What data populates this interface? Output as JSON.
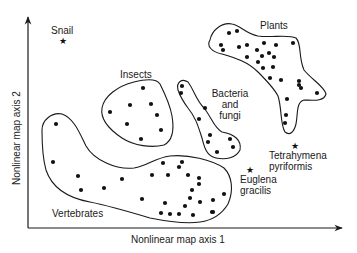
{
  "diagram": {
    "x_axis_label": "Nonlinear map axis 1",
    "y_axis_label": "Nonlinear map axis 2",
    "colors": {
      "ink": "#1a1a1a",
      "background": "#ffffff"
    }
  },
  "clusters": [
    {
      "name": "Plants",
      "label": "Plants",
      "label_pos": [
        260,
        29
      ],
      "outline": "M 210 40 C 212 30, 222 22, 232 24 C 240 25, 246 34, 258 36 C 272 38, 288 34, 296 38 C 302 44, 298 56, 304 70 C 312 80, 324 86, 326 94 C 324 102, 312 100, 304 100 C 296 102, 298 114, 296 124 C 294 132, 290 136, 285 132 C 280 124, 282 108, 278 96 C 274 88, 266 80, 258 72 C 248 62, 236 58, 222 54 C 212 52, 206 46, 210 40 Z",
      "points": [
        [
          229,
          33
        ],
        [
          237,
          31
        ],
        [
          221,
          45
        ],
        [
          223,
          50
        ],
        [
          239,
          47
        ],
        [
          247,
          45
        ],
        [
          264,
          43
        ],
        [
          257,
          50
        ],
        [
          276,
          45
        ],
        [
          293,
          43
        ],
        [
          247,
          57
        ],
        [
          262,
          56
        ],
        [
          269,
          53
        ],
        [
          274,
          57
        ],
        [
          258,
          62
        ],
        [
          273,
          67
        ],
        [
          263,
          68
        ],
        [
          270,
          78
        ],
        [
          281,
          80
        ],
        [
          299,
          81
        ],
        [
          299,
          85
        ],
        [
          301,
          88
        ],
        [
          317,
          93
        ],
        [
          287,
          99
        ],
        [
          286,
          115
        ],
        [
          285,
          123
        ]
      ]
    },
    {
      "name": "Insects",
      "label": "Insects",
      "label_pos": [
        120,
        78
      ],
      "outline": "M 102 108 C 104 96, 118 86, 134 82 C 146 79, 156 78, 160 84 C 164 92, 170 104, 172 116 C 174 128, 174 140, 164 145 C 152 148, 134 146, 122 138 C 110 130, 100 120, 102 108 Z",
      "points": [
        [
          143,
          88
        ],
        [
          130,
          105
        ],
        [
          151,
          104
        ],
        [
          110,
          112
        ],
        [
          157,
          115
        ],
        [
          127,
          124
        ],
        [
          161,
          130
        ],
        [
          141,
          139
        ]
      ]
    },
    {
      "name": "Bacteria and fungi",
      "label_lines": [
        "Bacteria",
        "and",
        "fungi"
      ],
      "label_pos": [
        230,
        97
      ],
      "outline": "M 178 90 C 176 82, 182 78, 188 82 C 194 90, 196 100, 204 108 C 212 118, 214 128, 222 132 C 234 134, 242 140, 240 150 C 236 158, 226 160, 216 158 C 206 156, 204 146, 202 138 C 198 126, 196 118, 188 108 C 182 100, 180 96, 178 90 Z",
      "points": [
        [
          182,
          86
        ],
        [
          181,
          93
        ],
        [
          205,
          108
        ],
        [
          199,
          119
        ],
        [
          210,
          135
        ],
        [
          208,
          142
        ],
        [
          230,
          139
        ],
        [
          233,
          147
        ],
        [
          217,
          152
        ]
      ]
    },
    {
      "name": "Vertebrates",
      "label": "Vertebrates",
      "label_pos": [
        52,
        217
      ],
      "outline": "M 42 130 C 42 120, 52 112, 62 114 C 74 118, 80 134, 86 146 C 94 160, 116 170, 134 168 C 148 166, 154 158, 170 156 C 188 154, 212 160, 224 168 C 232 176, 234 190, 228 204 C 222 214, 214 220, 200 222 C 186 224, 170 222, 150 218 C 130 212, 110 206, 90 202 C 68 198, 52 188, 46 170 C 42 156, 42 142, 42 130 Z",
      "points": [
        [
          56,
          124
        ],
        [
          53,
          162
        ],
        [
          78,
          176
        ],
        [
          81,
          190
        ],
        [
          104,
          188
        ],
        [
          122,
          179
        ],
        [
          163,
          163
        ],
        [
          182,
          162
        ],
        [
          179,
          167
        ],
        [
          152,
          175
        ],
        [
          168,
          175
        ],
        [
          188,
          175
        ],
        [
          199,
          178
        ],
        [
          199,
          184
        ],
        [
          192,
          190
        ],
        [
          190,
          198
        ],
        [
          142,
          199
        ],
        [
          165,
          203
        ],
        [
          200,
          202
        ],
        [
          185,
          206
        ],
        [
          213,
          200
        ],
        [
          224,
          194
        ],
        [
          212,
          212
        ],
        [
          161,
          213
        ],
        [
          170,
          214
        ],
        [
          179,
          214
        ],
        [
          193,
          215
        ],
        [
          213,
          212
        ]
      ]
    }
  ],
  "singletons": [
    {
      "name": "Snail",
      "label_lines": [
        "Snail"
      ],
      "star": [
        63,
        41
      ],
      "label_pos": [
        51,
        34
      ]
    },
    {
      "name": "Euglena gracilis",
      "label_lines": [
        "Euglena",
        "gracilis"
      ],
      "star": [
        250,
        170
      ],
      "label_pos": [
        240,
        183
      ]
    },
    {
      "name": "Tetrahymena pyriformis",
      "label_lines": [
        "Tetrahymena",
        "pyriformis"
      ],
      "star": [
        295,
        146
      ],
      "label_pos": [
        269,
        159
      ]
    }
  ]
}
